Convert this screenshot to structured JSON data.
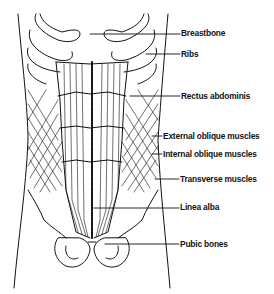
{
  "diagram": {
    "line_color": "#111111",
    "background": "#ffffff",
    "labels": [
      {
        "id": "breastbone",
        "text": "Breastbone",
        "x": 181,
        "y": 28,
        "line_from": [
          90,
          34
        ],
        "line_to": [
          180,
          34
        ]
      },
      {
        "id": "ribs",
        "text": "Ribs",
        "x": 181,
        "y": 49,
        "line_from": [
          146,
          54
        ],
        "line_to": [
          180,
          54
        ]
      },
      {
        "id": "rectus",
        "text": "Rectus abdominis",
        "x": 181,
        "y": 91,
        "line_from": [
          130,
          96
        ],
        "line_to": [
          180,
          96
        ]
      },
      {
        "id": "ext-oblique",
        "text": "External oblique muscles",
        "x": 163,
        "y": 131,
        "line_from": [
          152,
          136
        ],
        "line_to": [
          162,
          136
        ]
      },
      {
        "id": "int-oblique",
        "text": "Internal oblique muscles",
        "x": 163,
        "y": 149,
        "line_from": [
          152,
          154
        ],
        "line_to": [
          162,
          154
        ]
      },
      {
        "id": "transverse",
        "text": "Transverse muscles",
        "x": 180,
        "y": 174,
        "line_from": [
          155,
          179
        ],
        "line_to": [
          179,
          179
        ]
      },
      {
        "id": "linea-alba",
        "text": "Linea alba",
        "x": 180,
        "y": 202,
        "line_from": [
          94,
          208
        ],
        "line_to": [
          179,
          208
        ]
      },
      {
        "id": "pubic",
        "text": "Pubic bones",
        "x": 180,
        "y": 239,
        "line_from": [
          105,
          244
        ],
        "line_to": [
          179,
          244
        ]
      }
    ]
  }
}
